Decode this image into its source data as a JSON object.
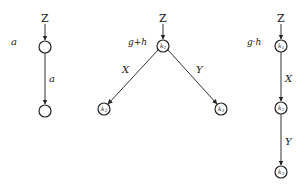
{
  "diagrams": [
    {
      "id": "diagram-a",
      "side_label": "a",
      "input_label": "Z",
      "nodes": [
        {
          "id": "n1",
          "label": "",
          "sub": ""
        },
        {
          "id": "n2",
          "label": "",
          "sub": ""
        }
      ],
      "edges": [
        {
          "from": "Z",
          "to": "n1",
          "label": ""
        },
        {
          "from": "n1",
          "to": "n2",
          "label": "a"
        }
      ]
    },
    {
      "id": "diagram-sum",
      "side_label": "g+h",
      "input_label": "Z",
      "nodes": [
        {
          "id": "k1",
          "label": "k",
          "sub": "1"
        },
        {
          "id": "k2",
          "label": "k",
          "sub": "2"
        },
        {
          "id": "k3",
          "label": "k",
          "sub": "3"
        }
      ],
      "edges": [
        {
          "from": "Z",
          "to": "k1",
          "label": ""
        },
        {
          "from": "k1",
          "to": "k2",
          "label": "X"
        },
        {
          "from": "k1",
          "to": "k3",
          "label": "Y"
        }
      ]
    },
    {
      "id": "diagram-product",
      "side_label": "g·h",
      "input_label": "Z",
      "nodes": [
        {
          "id": "k1",
          "label": "k",
          "sub": "1"
        },
        {
          "id": "k2",
          "label": "k",
          "sub": "2"
        },
        {
          "id": "k3",
          "label": "k",
          "sub": "3"
        }
      ],
      "edges": [
        {
          "from": "Z",
          "to": "k1",
          "label": ""
        },
        {
          "from": "k1",
          "to": "k2",
          "label": "X"
        },
        {
          "from": "k2",
          "to": "k3",
          "label": "Y"
        }
      ]
    }
  ]
}
